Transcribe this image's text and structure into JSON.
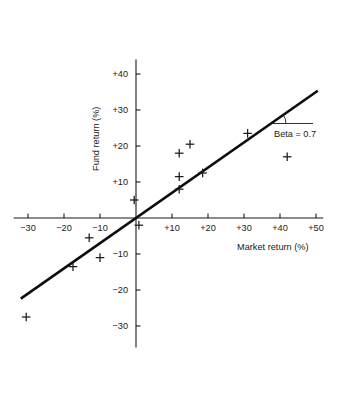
{
  "chart_data": {
    "type": "scatter",
    "title": "",
    "xlabel": "Market return (%)",
    "ylabel": "Fund return (%)",
    "xlim": [
      -34,
      52
    ],
    "ylim": [
      -36,
      44
    ],
    "grid": false,
    "legend": null,
    "x_ticks": [
      -30,
      -20,
      -10,
      10,
      20,
      30,
      40,
      50
    ],
    "x_tick_labels": [
      "−30",
      "−20",
      "−10",
      "+10",
      "+20",
      "+30",
      "+40",
      "+50"
    ],
    "y_ticks": [
      -30,
      -20,
      -10,
      10,
      20,
      30,
      40
    ],
    "y_tick_labels": [
      "−30",
      "−20",
      "−10",
      "+10",
      "+20",
      "+30",
      "+40"
    ],
    "points": [
      {
        "x": -30.5,
        "y": -27.5
      },
      {
        "x": -17.5,
        "y": -13.5
      },
      {
        "x": -13.0,
        "y": -5.5
      },
      {
        "x": -10.0,
        "y": -11.0
      },
      {
        "x": -0.5,
        "y": 5.0
      },
      {
        "x": 0.8,
        "y": -2.0
      },
      {
        "x": 12.0,
        "y": 8.0
      },
      {
        "x": 12.0,
        "y": 11.5
      },
      {
        "x": 12.0,
        "y": 18.0
      },
      {
        "x": 15.0,
        "y": 20.5
      },
      {
        "x": 18.5,
        "y": 12.5
      },
      {
        "x": 31.0,
        "y": 23.5
      },
      {
        "x": 42.0,
        "y": 17.0
      }
    ],
    "fit_line": {
      "slope": 0.7,
      "intercept": 0,
      "x_start": -32.0,
      "x_end": 50.5
    },
    "annotation": {
      "label": "Beta = 0.7",
      "value": 0.7
    }
  },
  "colors": {
    "ink": "#1a1a1a",
    "line": "#0d0d0d",
    "background": "#ffffff"
  }
}
